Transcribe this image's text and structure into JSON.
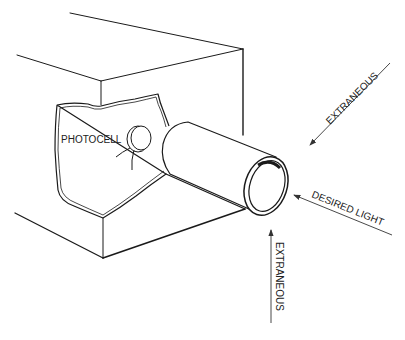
{
  "diagram": {
    "type": "technical line drawing",
    "labels": {
      "photocell": "PHOTOCELL",
      "extraneous_top": "EXTRANEOUS",
      "desired_light": "DESIRED LIGHT",
      "extraneous_bottom": "EXTRANEOUS"
    },
    "colors": {
      "line": "#1a1a1a",
      "background": "#ffffff"
    }
  }
}
